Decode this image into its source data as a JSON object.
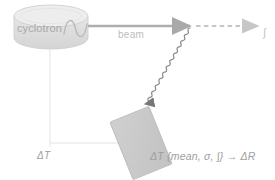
{
  "diagram": {
    "background_color": "#ffffff",
    "source": {
      "label": "cyclotron",
      "shape": "cylinder",
      "fill_color": "#e0e0e0",
      "top_fill_color": "#ebebeb",
      "stroke_color": "#c9c9c9",
      "oscillator_icon": "sine-wave-icon"
    },
    "beam": {
      "label": "beam",
      "arrow_color": "#b0b0b0",
      "style": "solid-arrow"
    },
    "continuation": {
      "style": "dashed-arrow",
      "color": "#c2c2c2",
      "symbol": "∫"
    },
    "scatter": {
      "style": "wavy-arrow",
      "color": "#8c8c8c",
      "description": "scattered radiation to detector"
    },
    "detector": {
      "shape": "rotated-rectangle",
      "fill_color": "#c8c8c8",
      "stroke_color": "#b5b5b5",
      "rotation_deg": -22
    },
    "measurement_lines": {
      "color": "#e2e2e2"
    },
    "annotations": {
      "delta_t": "ΔT",
      "detector_formula": "ΔT {mean, σ, ∫} → ΔR"
    }
  }
}
